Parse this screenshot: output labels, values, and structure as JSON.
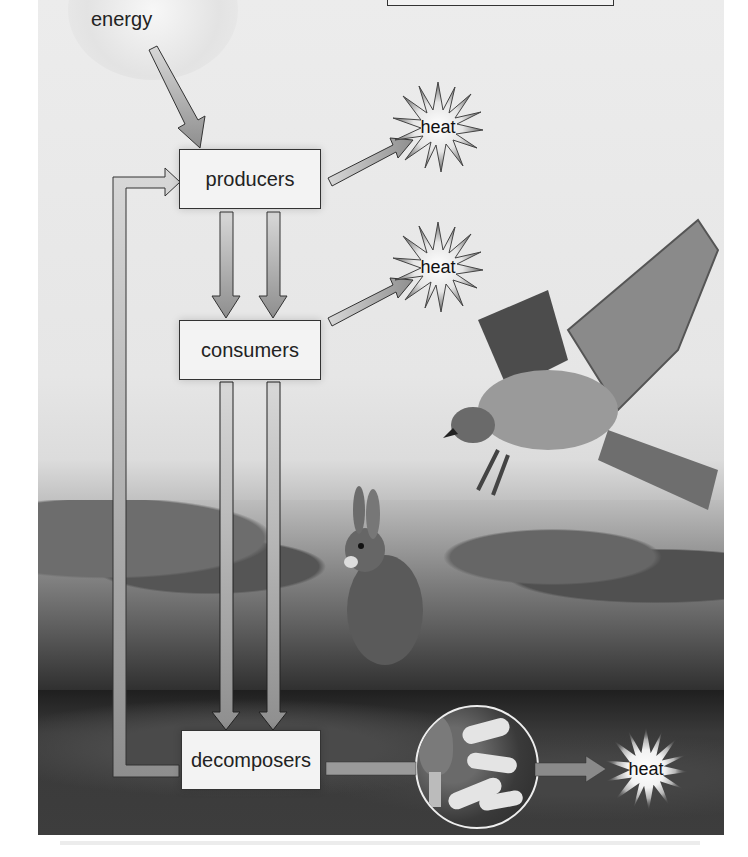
{
  "diagram": {
    "nodes": {
      "energy": {
        "label": "energy"
      },
      "producers": {
        "label": "producers"
      },
      "consumers": {
        "label": "consumers"
      },
      "decomposers": {
        "label": "decomposers"
      }
    },
    "heat_outputs": [
      {
        "id": "heat-producers",
        "label": "heat"
      },
      {
        "id": "heat-consumers",
        "label": "heat"
      },
      {
        "id": "heat-decomposers",
        "label": "heat"
      }
    ],
    "edges": [
      {
        "from": "energy",
        "to": "producers"
      },
      {
        "from": "producers",
        "to": "heat"
      },
      {
        "from": "producers",
        "to": "consumers"
      },
      {
        "from": "producers",
        "to": "consumers"
      },
      {
        "from": "consumers",
        "to": "heat"
      },
      {
        "from": "producers",
        "to": "decomposers"
      },
      {
        "from": "consumers",
        "to": "decomposers"
      },
      {
        "from": "consumers",
        "to": "decomposers"
      },
      {
        "from": "decomposers",
        "to": "producers"
      },
      {
        "from": "decomposers",
        "to": "heat"
      }
    ],
    "illustrations": [
      "hawk",
      "rabbit",
      "clover-plants",
      "grass",
      "soil",
      "morel-mushroom-and-grubs"
    ],
    "colors": {
      "arrow_fill": "#9a9a9a",
      "arrow_stroke": "#333333",
      "box_fill": "#f3f3f3",
      "box_border": "#333333",
      "background": "#e8e8e8",
      "soil": "#2f2f2f"
    }
  }
}
